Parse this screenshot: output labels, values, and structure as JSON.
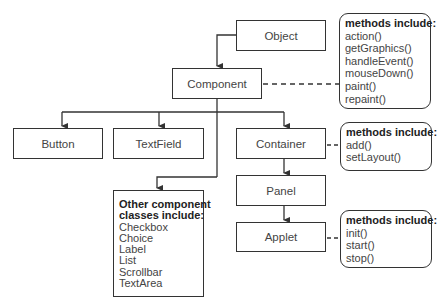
{
  "diagram": {
    "classes": {
      "object": "Object",
      "component": "Component",
      "button": "Button",
      "textfield": "TextField",
      "container": "Container",
      "panel": "Panel",
      "applet": "Applet"
    },
    "component_methods": {
      "header": "methods include:",
      "items": [
        "action()",
        "getGraphics()",
        "handleEvent()",
        "mouseDown()",
        "paint()",
        "repaint()"
      ]
    },
    "container_methods": {
      "header": "methods include:",
      "items": [
        "add()",
        "setLayout()"
      ]
    },
    "applet_methods": {
      "header": "methods include:",
      "items": [
        "init()",
        "start()",
        "stop()"
      ]
    },
    "other_classes": {
      "header_line1": "Other component",
      "header_line2": "classes include:",
      "items": [
        "Checkbox",
        "Choice",
        "Label",
        "List",
        "Scrollbar",
        "TextArea"
      ]
    },
    "colors": {
      "stroke": "#333333",
      "text": "#444444",
      "background": "#ffffff"
    }
  }
}
